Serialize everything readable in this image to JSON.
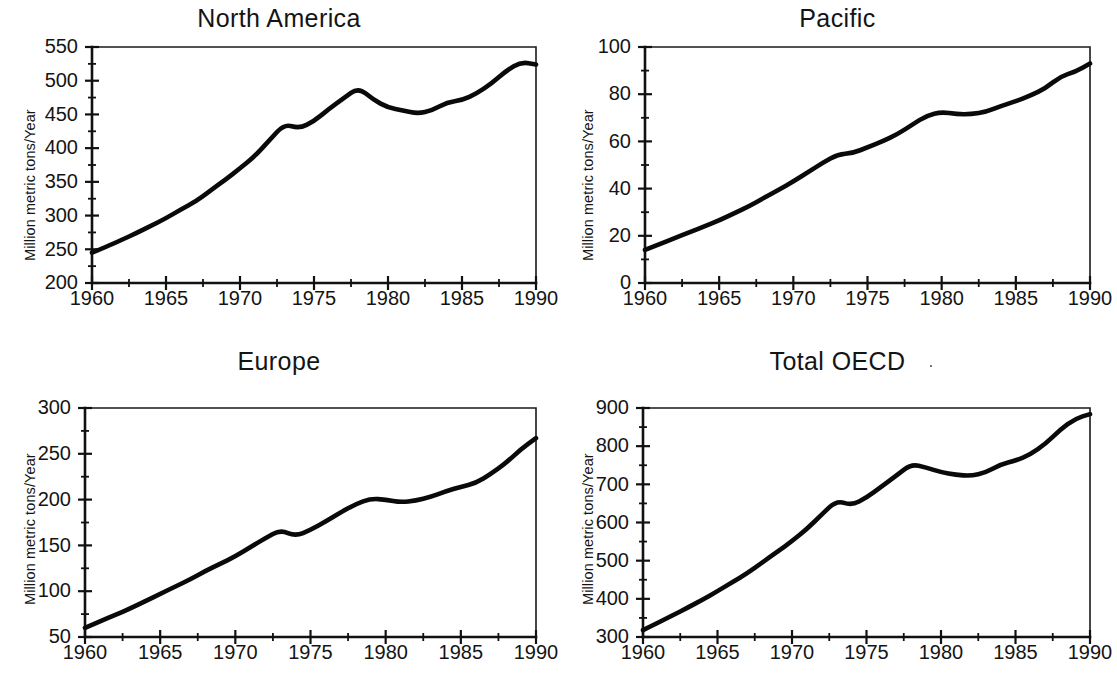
{
  "figure": {
    "background_color": "#ffffff",
    "line_color": "#0a0a0a",
    "axis_color": "#111111"
  },
  "panels": [
    {
      "id": "north-america",
      "title": "North America",
      "ylabel": "Million metric tons/Year",
      "ytick_labels": [
        "550",
        "500",
        "450",
        "400",
        "350",
        "300",
        "250",
        "200"
      ],
      "xtick_labels": [
        "1960",
        "1965",
        "1970",
        "1975",
        "1980",
        "1985",
        "1990"
      ]
    },
    {
      "id": "pacific",
      "title": "Pacific",
      "ylabel": "Million metric tons/Year",
      "ytick_labels": [
        "100",
        "80",
        "60",
        "40",
        "20",
        "0"
      ],
      "xtick_labels": [
        "1960",
        "1965",
        "1970",
        "1975",
        "1980",
        "1985",
        "1990"
      ]
    },
    {
      "id": "europe",
      "title": "Europe",
      "ylabel": "Million metric tons/Year",
      "ytick_labels": [
        "300",
        "250",
        "200",
        "150",
        "100",
        "50"
      ],
      "xtick_labels": [
        "1960",
        "1965",
        "1970",
        "1975",
        "1980",
        "1985",
        "1990"
      ]
    },
    {
      "id": "total-oecd",
      "title": "Total OECD",
      "ylabel": "Million metric tons/Year",
      "ytick_labels": [
        "900",
        "800",
        "700",
        "600",
        "500",
        "400",
        "300"
      ],
      "xtick_labels": [
        "1960",
        "1965",
        "1970",
        "1975",
        "1980",
        "1985",
        "1990"
      ]
    }
  ],
  "chart_data": [
    {
      "type": "line",
      "title": "North America",
      "xlabel": "",
      "ylabel": "Million metric tons/Year",
      "xlim": [
        1960,
        1990
      ],
      "ylim": [
        200,
        550
      ],
      "ytick_step": 50,
      "xtick_step": 5,
      "minor_ticks": true,
      "grid": false,
      "legend": "none",
      "x": [
        1960,
        1961,
        1962,
        1963,
        1964,
        1965,
        1966,
        1967,
        1968,
        1969,
        1970,
        1971,
        1972,
        1973,
        1974,
        1975,
        1976,
        1977,
        1978,
        1979,
        1980,
        1981,
        1982,
        1983,
        1984,
        1985,
        1986,
        1987,
        1988,
        1989,
        1990
      ],
      "values": [
        245,
        254,
        264,
        274,
        285,
        296,
        309,
        321,
        337,
        353,
        370,
        388,
        412,
        436,
        429,
        440,
        458,
        474,
        490,
        472,
        460,
        456,
        451,
        456,
        468,
        471,
        481,
        496,
        515,
        528,
        524
      ]
    },
    {
      "type": "line",
      "title": "Pacific",
      "xlabel": "",
      "ylabel": "Million metric tons/Year",
      "xlim": [
        1960,
        1990
      ],
      "ylim": [
        0,
        100
      ],
      "ytick_step": 20,
      "xtick_step": 5,
      "minor_ticks": true,
      "grid": false,
      "legend": "none",
      "x": [
        1960,
        1961,
        1962,
        1963,
        1964,
        1965,
        1966,
        1967,
        1968,
        1969,
        1970,
        1971,
        1972,
        1973,
        1974,
        1975,
        1976,
        1977,
        1978,
        1979,
        1980,
        1981,
        1982,
        1983,
        1984,
        1985,
        1986,
        1987,
        1988,
        1989,
        1990
      ],
      "values": [
        14,
        16.5,
        19,
        21.5,
        24,
        26.5,
        29.5,
        32.5,
        36,
        39.5,
        43,
        47,
        51,
        54.5,
        55,
        57.5,
        60,
        63,
        67,
        71,
        72.5,
        71.5,
        71.5,
        72.5,
        75,
        77,
        79.5,
        82.5,
        87.5,
        89.5,
        93
      ]
    },
    {
      "type": "line",
      "title": "Europe",
      "xlabel": "",
      "ylabel": "Million metric tons/Year",
      "xlim": [
        1960,
        1990
      ],
      "ylim": [
        50,
        300
      ],
      "ytick_step": 50,
      "xtick_step": 5,
      "minor_ticks": true,
      "grid": false,
      "legend": "none",
      "x": [
        1960,
        1961,
        1962,
        1963,
        1964,
        1965,
        1966,
        1967,
        1968,
        1969,
        1970,
        1971,
        1972,
        1973,
        1974,
        1975,
        1976,
        1977,
        1978,
        1979,
        1980,
        1981,
        1982,
        1983,
        1984,
        1985,
        1986,
        1987,
        1988,
        1989,
        1990
      ],
      "values": [
        60,
        67,
        74,
        81,
        89,
        97,
        105,
        113,
        122,
        130,
        138,
        148,
        158,
        167,
        160,
        167,
        176,
        186,
        195,
        201,
        200,
        197,
        199,
        203,
        209,
        214,
        218,
        228,
        240,
        255,
        267
      ]
    },
    {
      "type": "line",
      "title": "Total OECD",
      "xlabel": "",
      "ylabel": "Million metric tons/Year",
      "xlim": [
        1960,
        1990
      ],
      "ylim": [
        300,
        900
      ],
      "ytick_step": 100,
      "xtick_step": 5,
      "minor_ticks": true,
      "grid": false,
      "legend": "none",
      "x": [
        1960,
        1961,
        1962,
        1963,
        1964,
        1965,
        1966,
        1967,
        1968,
        1969,
        1970,
        1971,
        1972,
        1973,
        1974,
        1975,
        1976,
        1977,
        1978,
        1979,
        1980,
        1981,
        1982,
        1983,
        1984,
        1985,
        1986,
        1987,
        1988,
        1989,
        1990
      ],
      "values": [
        318,
        337,
        357,
        377,
        398,
        420,
        444,
        467,
        495,
        523,
        551,
        583,
        621,
        658,
        645,
        665,
        694,
        723,
        753,
        744,
        732,
        725,
        722,
        731,
        752,
        762,
        778,
        806,
        843,
        872,
        884
      ]
    }
  ]
}
